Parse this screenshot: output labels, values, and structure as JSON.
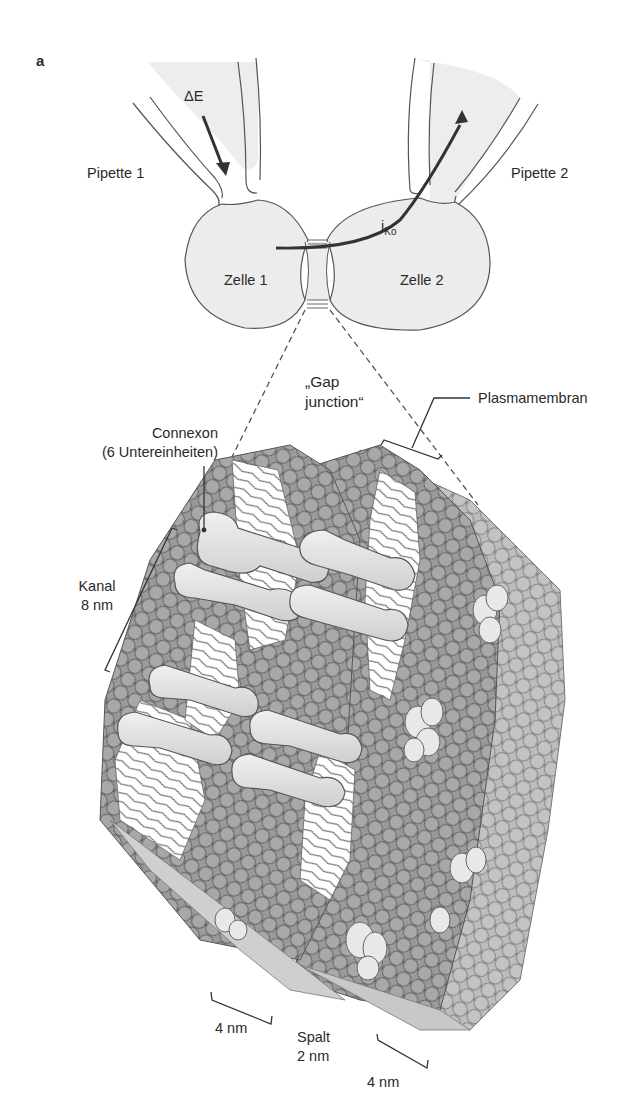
{
  "figure": {
    "panel_label": "a",
    "top": {
      "pipette_left": "Pipette 1",
      "pipette_right": "Pipette 2",
      "voltage_step": "ΔE",
      "current_symbol": "i",
      "current_subscript": "Ko",
      "cell_left": "Zelle 1",
      "cell_right": "Zelle 2"
    },
    "bottom": {
      "gap_junction_line1": "„Gap",
      "gap_junction_line2": "junction“",
      "plasma_membrane": "Plasmamembran",
      "connexon_line1": "Connexon",
      "connexon_line2": "(6 Untereinheiten)",
      "channel_line1": "Kanal",
      "channel_line2": "8 nm",
      "membrane_left_thickness": "4 nm",
      "cleft_line1": "Spalt",
      "cleft_line2": "2 nm",
      "membrane_right_thickness": "4 nm"
    },
    "colors": {
      "cell_fill": "#ececec",
      "outline": "#555555",
      "lipid_head": "#9a9a9a",
      "lipid_head_light": "#bdbdbd",
      "protein": "#e6e6e6",
      "arrow": "#333333"
    }
  }
}
